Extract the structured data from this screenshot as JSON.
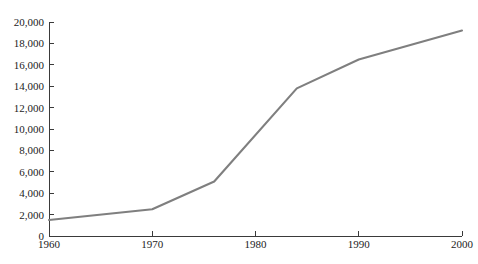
{
  "chart_data": {
    "type": "line",
    "title": "",
    "subtitle": "",
    "xlabel": "",
    "ylabel": "",
    "xlim": [
      1960,
      2000
    ],
    "ylim": [
      0,
      20000
    ],
    "grid": false,
    "legend": false,
    "legend_position": "none",
    "line_color": "#7f7f7f",
    "axis_color": "#3a3a3a",
    "background_color": "#ffffff",
    "x_ticks": [
      {
        "value": 1960,
        "label": "1960"
      },
      {
        "value": 1970,
        "label": "1970"
      },
      {
        "value": 1980,
        "label": "1980"
      },
      {
        "value": 1990,
        "label": "1990"
      },
      {
        "value": 2000,
        "label": "2000"
      }
    ],
    "y_ticks": [
      {
        "value": 0,
        "label": "0"
      },
      {
        "value": 2000,
        "label": "2,000"
      },
      {
        "value": 4000,
        "label": "4,000"
      },
      {
        "value": 6000,
        "label": "6,000"
      },
      {
        "value": 8000,
        "label": "8,000"
      },
      {
        "value": 10000,
        "label": "10,000"
      },
      {
        "value": 12000,
        "label": "12,000"
      },
      {
        "value": 14000,
        "label": "14,000"
      },
      {
        "value": 16000,
        "label": "16,000"
      },
      {
        "value": 18000,
        "label": "18,000"
      },
      {
        "value": 20000,
        "label": "20,000"
      }
    ],
    "series": [
      {
        "name": "series-1",
        "x": [
          1960,
          1970,
          1976,
          1984,
          1990,
          2000
        ],
        "values": [
          1500,
          2500,
          5100,
          13800,
          16500,
          19200
        ]
      }
    ]
  },
  "plot_geometry": {
    "left": 49,
    "right": 462,
    "top": 22,
    "bottom": 236,
    "tick_length": 5
  }
}
